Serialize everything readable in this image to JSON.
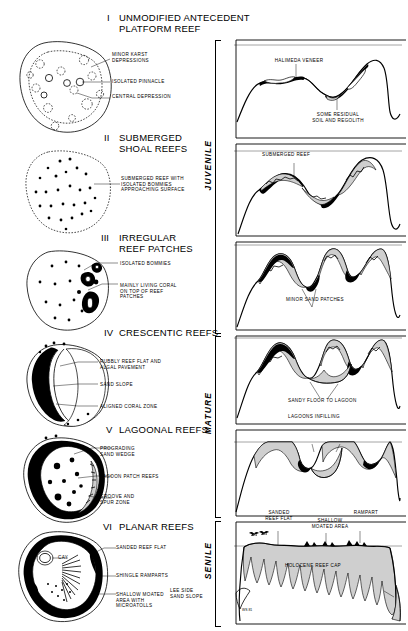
{
  "figure": {
    "signature": "WS 81"
  },
  "maturity_stages": [
    {
      "label": "JUVENILE"
    },
    {
      "label": "MATURE"
    },
    {
      "label": "SENILE"
    }
  ],
  "stages": [
    {
      "numeral": "I",
      "title": "UNMODIFIED ANTECEDENT\nPLATFORM REEF",
      "plan_labels": [
        {
          "text": "MINOR KARST\nDEPRESSIONS"
        },
        {
          "text": "ISOLATED PINNACLE"
        },
        {
          "text": "CENTRAL DEPRESSION"
        }
      ],
      "section_labels": [
        {
          "text": "HALIMEDA VENEER"
        },
        {
          "text": "SOME RESIDUAL\nSOIL AND REGOLITH"
        }
      ]
    },
    {
      "numeral": "II",
      "title": "SUBMERGED\nSHOAL REEFS",
      "plan_labels": [
        {
          "text": "SUBMERGED REEF WITH\nISOLATED BOMMIES\nAPPROACHING SURFACE"
        }
      ],
      "section_labels": [
        {
          "text": "SUBMERGED REEF"
        }
      ]
    },
    {
      "numeral": "III",
      "title": "IRREGULAR\nREEF PATCHES",
      "plan_labels": [
        {
          "text": "ISOLATED BOMMIES"
        },
        {
          "text": "MAINLY LIVING CORAL\nON TOP OF REEF\nPATCHES"
        }
      ],
      "section_labels": [
        {
          "text": "MINOR SAND PATCHES"
        }
      ]
    },
    {
      "numeral": "IV",
      "title": "CRESCENTIC REEFS",
      "plan_labels": [
        {
          "text": "RUBBLY REEF FLAT AND\nALGAL PAVEMENT"
        },
        {
          "text": "SAND SLOPE"
        },
        {
          "text": "ALIGNED CORAL ZONE"
        }
      ],
      "section_labels": [
        {
          "text": "SANDY FLOOR TO LAGOON"
        }
      ]
    },
    {
      "numeral": "V",
      "title": "LAGOONAL REEFS",
      "plan_labels": [
        {
          "text": "PROGRADING\nSAND WEDGE"
        },
        {
          "text": "LAGOON PATCH REEFS"
        },
        {
          "text": "GROOVE AND\nSPUR ZONE"
        }
      ],
      "section_labels": [
        {
          "text": "LAGOONS INFILLING"
        }
      ]
    },
    {
      "numeral": "VI",
      "title": "PLANAR REEFS",
      "plan_labels": [
        {
          "text": "CAY"
        },
        {
          "text": "SANDED REEF FLAT"
        },
        {
          "text": "SHINGLE RAMPARTS"
        },
        {
          "text": "SHALLOW MOATED\nAREA WITH\nMICROATOLLS"
        }
      ],
      "section_labels": [
        {
          "text": "SANDED\nREEF FLAT"
        },
        {
          "text": "SHALLOW\nMOATED AREA"
        },
        {
          "text": "RAMPART"
        },
        {
          "text": "LEE SIDE\nSAND SLOPE"
        },
        {
          "text": "HOLOCENE REEF CAP"
        }
      ]
    }
  ]
}
